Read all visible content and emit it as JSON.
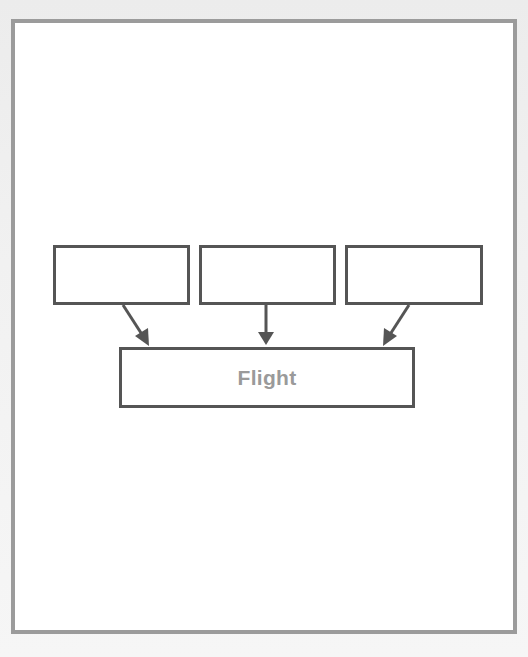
{
  "diagram": {
    "source_boxes": [
      {
        "label": ""
      },
      {
        "label": ""
      },
      {
        "label": ""
      }
    ],
    "target_box": {
      "label": "Flight"
    },
    "arrows": [
      {
        "from": "source_box_1",
        "to": "target_box"
      },
      {
        "from": "source_box_2",
        "to": "target_box"
      },
      {
        "from": "source_box_3",
        "to": "target_box"
      }
    ],
    "colors": {
      "frame_border": "#9b9b9b",
      "box_border": "#555555",
      "arrow": "#555555",
      "label_text": "#9a9a9a"
    }
  }
}
